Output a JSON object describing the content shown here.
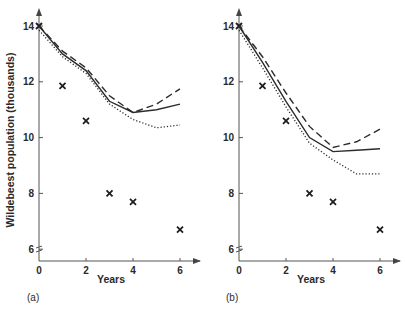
{
  "figure": {
    "ylabel": "Wildebeest population (thousands)",
    "panels": [
      {
        "label": "(a)",
        "xlabel": "Years"
      },
      {
        "label": "(b)",
        "xlabel": "Years"
      }
    ]
  },
  "chart_data": [
    {
      "type": "line",
      "title": "(a)",
      "xlabel": "Years",
      "ylabel": "Wildebeest population (thousands)",
      "xlim": [
        0,
        6.5
      ],
      "ylim": [
        5.6,
        14.5
      ],
      "xticks": [
        0,
        2,
        4,
        6
      ],
      "yticks": [
        6,
        8,
        10,
        12,
        14
      ],
      "grid": false,
      "legend": "none",
      "axis_break_on_y": true,
      "series": [
        {
          "name": "observed",
          "style": "cross-markers",
          "x": [
            0,
            1,
            2,
            3,
            4,
            6
          ],
          "y": [
            14.0,
            11.85,
            10.6,
            8.0,
            7.7,
            6.7
          ]
        },
        {
          "name": "model-solid",
          "style": "solid",
          "x": [
            0,
            1,
            2,
            3,
            4,
            5,
            6
          ],
          "y": [
            14.0,
            13.0,
            12.4,
            11.3,
            10.9,
            11.0,
            11.2
          ]
        },
        {
          "name": "model-dashed",
          "style": "dashed",
          "x": [
            0,
            1,
            2,
            3,
            4,
            5,
            6
          ],
          "y": [
            14.0,
            13.1,
            12.5,
            11.5,
            10.9,
            11.2,
            11.75
          ]
        },
        {
          "name": "model-dotted",
          "style": "dotted",
          "x": [
            0,
            1,
            2,
            3,
            4,
            5,
            6
          ],
          "y": [
            13.85,
            12.9,
            12.3,
            11.2,
            10.65,
            10.35,
            10.45
          ]
        }
      ]
    },
    {
      "type": "line",
      "title": "(b)",
      "xlabel": "Years",
      "ylabel": "Wildebeest population (thousands)",
      "xlim": [
        0,
        6.5
      ],
      "ylim": [
        5.6,
        14.5
      ],
      "xticks": [
        0,
        2,
        4,
        6
      ],
      "yticks": [
        6,
        8,
        10,
        12,
        14
      ],
      "grid": false,
      "legend": "none",
      "axis_break_on_y": true,
      "series": [
        {
          "name": "observed",
          "style": "cross-markers",
          "x": [
            0,
            1,
            2,
            3,
            4,
            6
          ],
          "y": [
            14.0,
            11.85,
            10.6,
            8.0,
            7.7,
            6.7
          ]
        },
        {
          "name": "model-solid",
          "style": "solid",
          "x": [
            0,
            1,
            2,
            3,
            4,
            5,
            6
          ],
          "y": [
            14.0,
            12.7,
            11.3,
            10.0,
            9.5,
            9.55,
            9.6
          ]
        },
        {
          "name": "model-dashed",
          "style": "dashed",
          "x": [
            0,
            1,
            2,
            3,
            4,
            5,
            6
          ],
          "y": [
            14.0,
            12.9,
            11.6,
            10.4,
            9.65,
            9.85,
            10.3
          ]
        },
        {
          "name": "model-dotted",
          "style": "dotted",
          "x": [
            0,
            1,
            2,
            3,
            4,
            5,
            6
          ],
          "y": [
            13.85,
            12.5,
            11.1,
            9.8,
            9.2,
            8.7,
            8.7
          ]
        }
      ]
    }
  ]
}
